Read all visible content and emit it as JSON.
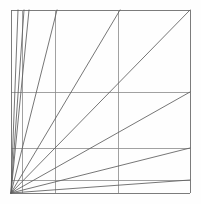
{
  "figure": {
    "type": "line-diagram",
    "background_color": "#fefefe",
    "canvas": {
      "width": 201,
      "height": 204
    }
  },
  "style": {
    "frame_color": "#6e6e6e",
    "grid_color": "#8a8a8a",
    "diagonal_color": "#5d5d5d",
    "frame_width": 0.9,
    "grid_width": 0.8,
    "diagonal_width": 0.85
  },
  "geometry": {
    "frame": {
      "left": 11,
      "top": 10,
      "right": 190,
      "bottom": 193
    },
    "origin": {
      "x": 11,
      "y": 193,
      "label": "pencil-vertex-lower-left"
    },
    "vertical_lines": [
      {
        "name": "frame-left",
        "x": 11,
        "y1": 10,
        "y2": 193
      },
      {
        "name": "vertical-1",
        "x": 22,
        "y1": 10,
        "y2": 193
      },
      {
        "name": "vertical-2",
        "x": 55,
        "y1": 10,
        "y2": 193
      },
      {
        "name": "vertical-3",
        "x": 118,
        "y1": 10,
        "y2": 193
      },
      {
        "name": "frame-right",
        "x": 190,
        "y1": 10,
        "y2": 193
      }
    ],
    "horizontal_lines": [
      {
        "name": "frame-top",
        "y": 10,
        "x1": 11,
        "x2": 190
      },
      {
        "name": "horizontal-1",
        "y": 92,
        "x1": 11,
        "x2": 190
      },
      {
        "name": "horizontal-2",
        "y": 148,
        "x1": 11,
        "x2": 190
      },
      {
        "name": "horizontal-3",
        "y": 180,
        "x1": 11,
        "x2": 190
      },
      {
        "name": "frame-bottom",
        "y": 193,
        "x1": 11,
        "x2": 190
      }
    ],
    "diagonals": [
      {
        "name": "diagonal-to-top-at-x18",
        "x1": 11,
        "y1": 193,
        "x2": 18,
        "y2": 10
      },
      {
        "name": "diagonal-to-top-at-x24",
        "x1": 11,
        "y1": 193,
        "x2": 24,
        "y2": 10
      },
      {
        "name": "diagonal-to-top-at-x29",
        "x1": 11,
        "y1": 193,
        "x2": 29,
        "y2": 10
      },
      {
        "name": "diagonal-to-top-at-x57",
        "x1": 11,
        "y1": 193,
        "x2": 57,
        "y2": 10
      },
      {
        "name": "diagonal-to-top-at-x120",
        "x1": 11,
        "y1": 193,
        "x2": 120,
        "y2": 10
      },
      {
        "name": "diagonal-to-top-right-corner",
        "x1": 11,
        "y1": 193,
        "x2": 190,
        "y2": 10
      },
      {
        "name": "diagonal-to-right-at-y92",
        "x1": 11,
        "y1": 193,
        "x2": 190,
        "y2": 92
      },
      {
        "name": "diagonal-to-right-at-y148",
        "x1": 11,
        "y1": 193,
        "x2": 190,
        "y2": 148
      },
      {
        "name": "diagonal-to-right-at-y180",
        "x1": 11,
        "y1": 193,
        "x2": 190,
        "y2": 180
      }
    ]
  }
}
